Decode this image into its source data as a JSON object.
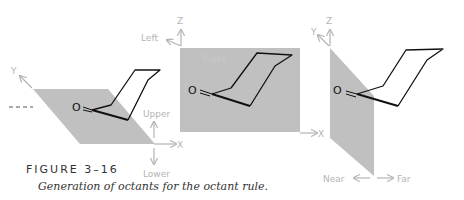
{
  "figure": {
    "number_label": "FIGURE 3–16",
    "caption": "Generation of octants for the octant rule."
  },
  "panels": [
    {
      "id": "panel-1",
      "plane": "horizontal (XY)",
      "axis_labels": {
        "y": "Y",
        "upper": "Upper",
        "lower": "Lower",
        "x": "X"
      },
      "atom_label": "O"
    },
    {
      "id": "panel-2",
      "plane": "vertical (XZ)",
      "axis_labels": {
        "z": "Z",
        "left": "Left",
        "right": "Right",
        "x": "X"
      },
      "atom_label": "O"
    },
    {
      "id": "panel-3",
      "plane": "vertical (YZ)",
      "axis_labels": {
        "y": "Y",
        "z": "Z",
        "near": "Near",
        "far": "Far",
        "x": "X"
      },
      "atom_label": "O"
    }
  ],
  "colors": {
    "plane": "#c0c0c0",
    "axis": "#b4b4b4",
    "structure": "#111111"
  }
}
